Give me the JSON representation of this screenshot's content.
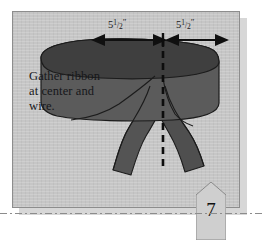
{
  "figure": {
    "title": "Gather ribbon at center and wire",
    "panel_color": "#c6c6c6",
    "ribbon_color": "#5a5a5a",
    "ribbon_shadow_color": "#474747",
    "outline_color": "#1c1c1c"
  },
  "caption": {
    "line1": "Gather ribbon",
    "line2": "at center and",
    "line3": "wire."
  },
  "dimensions": {
    "left": {
      "whole": "5",
      "numerator": "1",
      "slash": "/",
      "denominator": "2",
      "unit": "″",
      "full_text": "5 1/2\""
    },
    "right": {
      "whole": "5",
      "numerator": "1",
      "slash": "/",
      "denominator": "2",
      "unit": "″",
      "full_text": "5 1/2\""
    }
  },
  "icons": {
    "left_arrow": "double-headed-arrow-icon",
    "right_arrow": "double-headed-arrow-icon",
    "center_tick": "center-tick-icon",
    "center_line": "dashed-centerline-icon",
    "ribbon": "ribbon-bow-illustration"
  },
  "page_banner": {
    "number": "7"
  }
}
